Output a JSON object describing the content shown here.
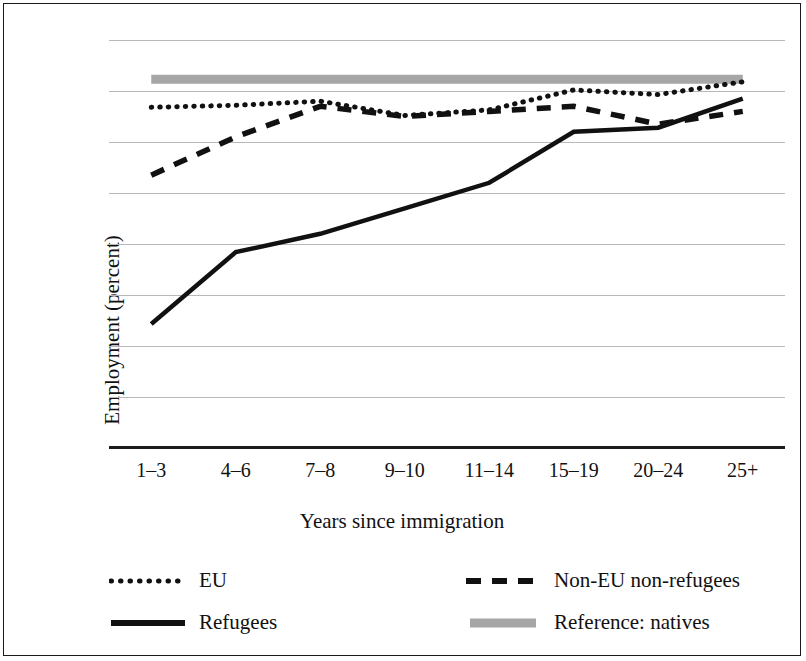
{
  "chart_data": {
    "type": "line",
    "title": "",
    "xlabel": "Years since immigration",
    "ylabel": "Employment (percent)",
    "categories": [
      "1–3",
      "4–6",
      "7–8",
      "9–10",
      "11–14",
      "15–19",
      "20–24",
      "25+"
    ],
    "ylim": [
      0,
      80
    ],
    "yticks": [
      0,
      10,
      20,
      30,
      40,
      50,
      60,
      70,
      80
    ],
    "grid": true,
    "legend_position": "bottom",
    "series": [
      {
        "name": "EU",
        "style": "dotted",
        "color": "#111111",
        "values": [
          66.8,
          67.2,
          68.0,
          65.2,
          66.3,
          70.2,
          69.3,
          71.8
        ]
      },
      {
        "name": "Non-EU non-refugees",
        "style": "dashed",
        "color": "#111111",
        "values": [
          53.5,
          61.0,
          67.0,
          65.0,
          66.0,
          67.0,
          63.5,
          66.0
        ]
      },
      {
        "name": "Refugees",
        "style": "solid",
        "color": "#111111",
        "values": [
          24.3,
          38.4,
          42.0,
          47.0,
          52.0,
          62.0,
          62.8,
          68.5
        ]
      },
      {
        "name": "Reference: natives",
        "style": "solid-thick-gray",
        "color": "#a6a6a6",
        "values": [
          72.3,
          72.3,
          72.3,
          72.3,
          72.3,
          72.3,
          72.3,
          72.3
        ]
      }
    ]
  },
  "legend": {
    "items": [
      {
        "label": "EU",
        "icon": "dotted-line-icon"
      },
      {
        "label": "Non-EU non-refugees",
        "icon": "dashed-line-icon"
      },
      {
        "label": "Refugees",
        "icon": "solid-line-icon"
      },
      {
        "label": "Reference: natives",
        "icon": "thick-gray-line-icon"
      }
    ]
  }
}
